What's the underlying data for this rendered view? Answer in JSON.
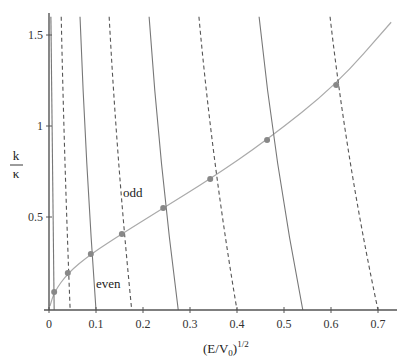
{
  "chart_data": {
    "type": "line",
    "title": "",
    "xlabel": "(E/V0)^1/2",
    "xlabel_parts": {
      "base": "(E/V",
      "sub": "0",
      "close": ")",
      "sup": "1/2"
    },
    "ylabel": "k/κ",
    "ylabel_parts": {
      "num": "k",
      "den": "κ"
    },
    "xlim": [
      0,
      0.72
    ],
    "ylim": [
      0,
      1.6
    ],
    "x_ticks": [
      "0",
      "0.1",
      "0.2",
      "0.3",
      "0.4",
      "0.5",
      "0.6",
      "0.7"
    ],
    "x_tick_values": [
      0,
      0.1,
      0.2,
      0.3,
      0.4,
      0.5,
      0.6,
      0.7
    ],
    "y_ticks": [
      "0.5",
      "1",
      "1.5"
    ],
    "y_tick_values": [
      0.5,
      1.0,
      1.5
    ],
    "grid": false,
    "legend": null,
    "annotations": [
      {
        "text": "odd",
        "x": 0.165,
        "y": 0.63
      },
      {
        "text": "even",
        "x": 0.1,
        "y": 0.14
      }
    ],
    "series": [
      {
        "name": "constraint curve",
        "style": "solid-light",
        "color": "#aaaaaa",
        "x": [
          0.002,
          0.011,
          0.04,
          0.089,
          0.155,
          0.243,
          0.343,
          0.464,
          0.611,
          0.728
        ],
        "y": [
          0.01,
          0.088,
          0.192,
          0.297,
          0.407,
          0.549,
          0.709,
          0.923,
          1.225,
          1.57
        ]
      },
      {
        "name": "even n=1",
        "style": "solid",
        "color": "#777777",
        "x": [
          0.004,
          0.011
        ],
        "y": [
          1.6,
          0.0
        ]
      },
      {
        "name": "odd n=1",
        "style": "dashed",
        "color": "#555555",
        "x": [
          0.026,
          0.045
        ],
        "y": [
          1.6,
          0.0
        ]
      },
      {
        "name": "even n=2",
        "style": "solid",
        "color": "#777777",
        "x": [
          0.066,
          0.1
        ],
        "y": [
          1.6,
          0.0
        ]
      },
      {
        "name": "odd n=2",
        "style": "dashed",
        "color": "#555555",
        "x": [
          0.128,
          0.176
        ],
        "y": [
          1.6,
          0.0
        ]
      },
      {
        "name": "even n=3",
        "style": "solid",
        "color": "#777777",
        "x": [
          0.213,
          0.275
        ],
        "y": [
          1.6,
          0.0
        ]
      },
      {
        "name": "odd n=3",
        "style": "dashed",
        "color": "#555555",
        "x": [
          0.319,
          0.4
        ],
        "y": [
          1.6,
          0.0
        ]
      },
      {
        "name": "even n=4",
        "style": "solid",
        "color": "#777777",
        "x": [
          0.447,
          0.54
        ],
        "y": [
          1.6,
          0.0
        ]
      },
      {
        "name": "odd n=4",
        "style": "dashed",
        "color": "#555555",
        "x": [
          0.598,
          0.7
        ],
        "y": [
          1.6,
          0.0
        ]
      }
    ],
    "points": {
      "name": "intersections",
      "color": "#888888",
      "x": [
        0.011,
        0.04,
        0.089,
        0.155,
        0.243,
        0.343,
        0.464,
        0.611
      ],
      "y": [
        0.088,
        0.192,
        0.297,
        0.407,
        0.549,
        0.709,
        0.923,
        1.225
      ]
    }
  }
}
